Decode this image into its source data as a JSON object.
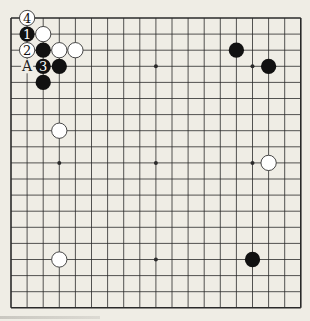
{
  "diagram": {
    "type": "go-board",
    "size": 19,
    "origin": {
      "x": 11,
      "y": 18
    },
    "spacing": 16.1,
    "colors": {
      "background": "#efede5",
      "line": "#2a2a2a",
      "black_stone": "#111111",
      "white_stone": "#ffffff",
      "white_stroke": "#333333"
    },
    "star_points": [
      [
        3,
        3
      ],
      [
        9,
        3
      ],
      [
        15,
        3
      ],
      [
        3,
        9
      ],
      [
        9,
        9
      ],
      [
        15,
        9
      ],
      [
        3,
        15
      ],
      [
        9,
        15
      ],
      [
        15,
        15
      ]
    ],
    "stones": [
      {
        "color": "white",
        "col": 1,
        "row": 0,
        "label": "4"
      },
      {
        "color": "black",
        "col": 1,
        "row": 1,
        "label": "1"
      },
      {
        "color": "white",
        "col": 2,
        "row": 1,
        "label": ""
      },
      {
        "color": "white",
        "col": 1,
        "row": 2,
        "label": "2"
      },
      {
        "color": "black",
        "col": 2,
        "row": 2,
        "label": ""
      },
      {
        "color": "white",
        "col": 3,
        "row": 2,
        "label": ""
      },
      {
        "color": "white",
        "col": 4,
        "row": 2,
        "label": ""
      },
      {
        "color": "black",
        "col": 2,
        "row": 3,
        "label": "3"
      },
      {
        "color": "black",
        "col": 3,
        "row": 3,
        "label": ""
      },
      {
        "color": "black",
        "col": 2,
        "row": 4,
        "label": ""
      },
      {
        "color": "black",
        "col": 14,
        "row": 2,
        "label": ""
      },
      {
        "color": "black",
        "col": 16,
        "row": 3,
        "label": ""
      },
      {
        "color": "white",
        "col": 3,
        "row": 7,
        "label": ""
      },
      {
        "color": "white",
        "col": 16,
        "row": 9,
        "label": ""
      },
      {
        "color": "white",
        "col": 3,
        "row": 15,
        "label": ""
      },
      {
        "color": "black",
        "col": 15,
        "row": 15,
        "label": ""
      }
    ],
    "point_labels": [
      {
        "col": 1,
        "row": 3,
        "text": "A"
      }
    ]
  }
}
